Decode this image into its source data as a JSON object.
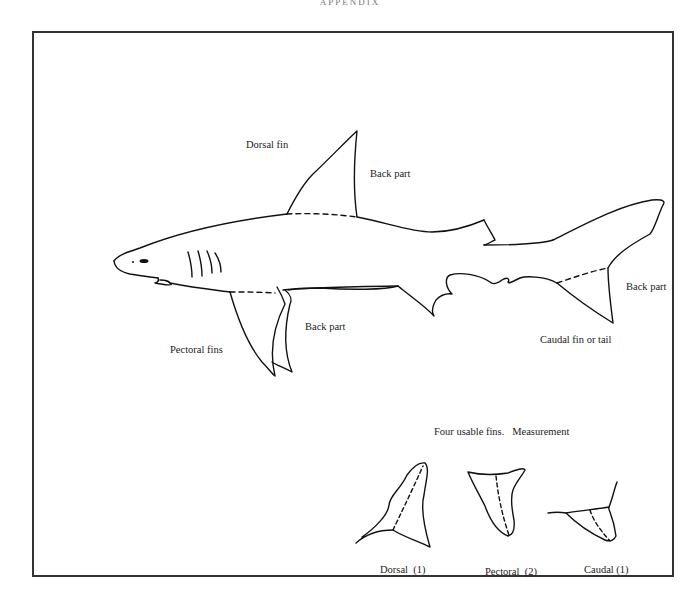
{
  "page": {
    "header": "APPENDIX"
  },
  "diagram": {
    "labels": {
      "dorsal_fin": "Dorsal fin",
      "dorsal_back_part": "Back part",
      "pectoral_fins": "Pectoral fins",
      "pectoral_back_part": "Back part",
      "caudal_fin": "Caudal fin or tail",
      "caudal_back_part": "Back part"
    },
    "measurement_section": {
      "heading": "Four usable fins.   Measurement",
      "fins": [
        {
          "name": "Dorsal",
          "count": 1,
          "caption": "Dorsal  (1)"
        },
        {
          "name": "Pectoral",
          "count": 2,
          "caption": "Pectoral  (2)"
        },
        {
          "name": "Caudal",
          "count": 1,
          "caption": "Caudal (1)"
        }
      ]
    },
    "colors": {
      "stroke": "#111111",
      "frame": "#333333",
      "background": "#ffffff"
    }
  }
}
